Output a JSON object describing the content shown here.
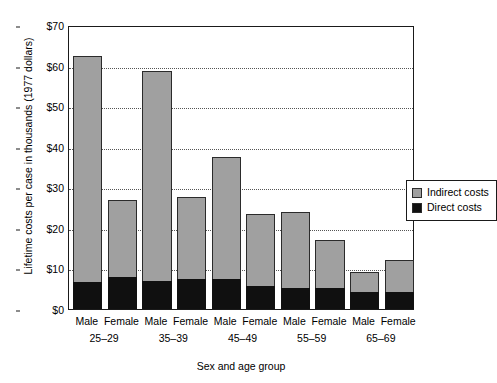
{
  "chart_data": {
    "type": "bar",
    "title": "",
    "subtitle": "",
    "xlabel": "Sex and age group",
    "ylabel": "Lifetime costs per case in thousands (1977 dollars)",
    "stacked": true,
    "grid": true,
    "grid_style": "dotted horizontal",
    "legend_position": "top-right inside plot",
    "ylim": [
      0,
      70
    ],
    "ytick_values": [
      0,
      10,
      20,
      30,
      40,
      50,
      60,
      70
    ],
    "ytick_labels": [
      "$0",
      "$10",
      "$20",
      "$30",
      "$40",
      "$50",
      "$60",
      "$70"
    ],
    "categories": [
      "Male 25–29",
      "Female 25–29",
      "Male 35–39",
      "Female 35–39",
      "Male 45–49",
      "Female 45–49",
      "Male 55–59",
      "Female 55–59",
      "Male 65–69",
      "Female 65–69"
    ],
    "sex_labels": [
      "Male",
      "Female",
      "Male",
      "Female",
      "Male",
      "Female",
      "Male",
      "Female",
      "Male",
      "Female"
    ],
    "age_groups": [
      "25–29",
      "35–39",
      "45–49",
      "55–59",
      "65–69"
    ],
    "series": [
      {
        "name": "Direct costs",
        "color": "#101010",
        "values": [
          6.7,
          7.9,
          6.9,
          7.4,
          7.4,
          5.6,
          5.3,
          5.3,
          4.2,
          4.2
        ]
      },
      {
        "name": "Indirect costs",
        "color": "#a0a0a0",
        "values": [
          55.7,
          18.9,
          51.8,
          20.1,
          30.1,
          17.9,
          18.5,
          11.7,
          5.0,
          7.9
        ]
      }
    ],
    "totals": [
      62.4,
      26.8,
      58.7,
      27.5,
      37.5,
      23.5,
      23.8,
      17.0,
      9.2,
      12.1
    ],
    "legend_entries": [
      "Indirect costs",
      "Direct costs"
    ]
  },
  "legend": {
    "indirect_label": "Indirect costs",
    "direct_label": "Direct costs"
  },
  "colors": {
    "indirect": "#a0a0a0",
    "direct": "#101010",
    "axis": "#1a1a1a",
    "grid": "#555555",
    "background": "#ffffff"
  }
}
